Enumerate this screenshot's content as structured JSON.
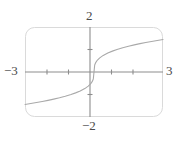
{
  "figure": {
    "name": "graphing-calculator-viewing-window",
    "background_color": "#ffffff",
    "frame_color": "#d8d8d8",
    "axis_color": "#8a8a8a",
    "curve_color": "#a8a8a8",
    "label_color": "#4a4a4a"
  },
  "labels": {
    "y_max": "2",
    "y_min": "−2",
    "x_min": "−3",
    "x_max": "3"
  },
  "chart_data": {
    "type": "line",
    "title": "",
    "subtitle": "",
    "xlabel": "",
    "ylabel": "",
    "xlim": [
      -3,
      3
    ],
    "ylim": [
      -2,
      2
    ],
    "grid": false,
    "legend": null,
    "legend_position": "none",
    "x_tick_labels": [
      "−3",
      "3"
    ],
    "y_tick_labels": [
      "2",
      "−2"
    ],
    "x_ticks": [
      -2,
      -1,
      1,
      2
    ],
    "y_ticks": [
      -1,
      1
    ],
    "annotations": [],
    "series": [
      {
        "name": "cube root curve",
        "description": "odd increasing curve through origin, concave down for x>0 and concave up for x<0",
        "x": [
          -3.0,
          -2.75,
          -2.5,
          -2.25,
          -2.0,
          -1.75,
          -1.5,
          -1.25,
          -1.0,
          -0.8,
          -0.6,
          -0.4,
          -0.25,
          -0.15,
          -0.08,
          -0.03,
          0.0,
          0.03,
          0.08,
          0.15,
          0.25,
          0.4,
          0.6,
          0.8,
          1.0,
          1.25,
          1.5,
          1.75,
          2.0,
          2.25,
          2.5,
          2.75,
          3.0
        ],
        "y": [
          -1.442,
          -1.402,
          -1.357,
          -1.31,
          -1.26,
          -1.205,
          -1.145,
          -1.077,
          -1.0,
          -0.928,
          -0.843,
          -0.737,
          -0.63,
          -0.531,
          -0.43,
          -0.311,
          0.0,
          0.311,
          0.43,
          0.531,
          0.63,
          0.737,
          0.843,
          0.928,
          1.0,
          1.077,
          1.145,
          1.205,
          1.26,
          1.31,
          1.357,
          1.402,
          1.442
        ]
      }
    ]
  }
}
